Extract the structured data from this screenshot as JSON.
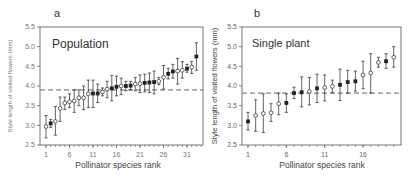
{
  "chart_data": [
    {
      "panel": "a",
      "type": "scatter",
      "title": "Population",
      "xlabel": "Pollinator species rank",
      "ylabel": "Style length of visited flowers (mm)",
      "xticks": [
        1,
        6,
        11,
        16,
        21,
        26,
        31
      ],
      "yticks": [
        2.5,
        3.0,
        3.5,
        4.0,
        4.5,
        5.0,
        5.5
      ],
      "ylim": [
        2.5,
        5.5
      ],
      "xlim": [
        0,
        34
      ],
      "reference_line": 3.9,
      "grid": false,
      "points": [
        {
          "x": 1,
          "y": 2.97,
          "lo": 2.68,
          "hi": 3.25,
          "filled": false
        },
        {
          "x": 2,
          "y": 3.05,
          "lo": 2.95,
          "hi": 3.15,
          "filled": true
        },
        {
          "x": 3,
          "y": 3.1,
          "lo": 2.75,
          "hi": 3.48,
          "filled": false
        },
        {
          "x": 4,
          "y": 3.43,
          "lo": 3.1,
          "hi": 3.72,
          "filled": false
        },
        {
          "x": 5,
          "y": 3.57,
          "lo": 3.4,
          "hi": 3.72,
          "filled": false
        },
        {
          "x": 6,
          "y": 3.6,
          "lo": 3.45,
          "hi": 3.8,
          "filled": false
        },
        {
          "x": 7,
          "y": 3.62,
          "lo": 3.33,
          "hi": 3.9,
          "filled": false
        },
        {
          "x": 8,
          "y": 3.7,
          "lo": 3.5,
          "hi": 3.9,
          "filled": false
        },
        {
          "x": 9,
          "y": 3.7,
          "lo": 3.4,
          "hi": 4.0,
          "filled": false
        },
        {
          "x": 10,
          "y": 3.8,
          "lo": 3.45,
          "hi": 4.15,
          "filled": false
        },
        {
          "x": 11,
          "y": 3.81,
          "lo": 3.45,
          "hi": 4.15,
          "filled": true
        },
        {
          "x": 12,
          "y": 3.81,
          "lo": 3.58,
          "hi": 4.05,
          "filled": true
        },
        {
          "x": 13,
          "y": 3.85,
          "lo": 3.75,
          "hi": 3.95,
          "filled": false
        },
        {
          "x": 14,
          "y": 3.92,
          "lo": 3.7,
          "hi": 4.12,
          "filled": false
        },
        {
          "x": 15,
          "y": 3.94,
          "lo": 3.62,
          "hi": 4.27,
          "filled": true
        },
        {
          "x": 16,
          "y": 3.98,
          "lo": 3.75,
          "hi": 4.25,
          "filled": true
        },
        {
          "x": 17,
          "y": 4.0,
          "lo": 3.78,
          "hi": 4.2,
          "filled": false
        },
        {
          "x": 18,
          "y": 4.0,
          "lo": 3.88,
          "hi": 4.12,
          "filled": true
        },
        {
          "x": 19,
          "y": 4.01,
          "lo": 3.9,
          "hi": 4.12,
          "filled": true
        },
        {
          "x": 20,
          "y": 4.05,
          "lo": 3.88,
          "hi": 4.22,
          "filled": false
        },
        {
          "x": 21,
          "y": 4.06,
          "lo": 3.83,
          "hi": 4.28,
          "filled": false
        },
        {
          "x": 22,
          "y": 4.08,
          "lo": 3.85,
          "hi": 4.3,
          "filled": true
        },
        {
          "x": 23,
          "y": 4.09,
          "lo": 3.83,
          "hi": 4.33,
          "filled": true
        },
        {
          "x": 24,
          "y": 4.1,
          "lo": 3.8,
          "hi": 4.38,
          "filled": true
        },
        {
          "x": 25,
          "y": 4.12,
          "lo": 4.03,
          "hi": 4.22,
          "filled": false
        },
        {
          "x": 26,
          "y": 4.22,
          "lo": 3.92,
          "hi": 4.52,
          "filled": false
        },
        {
          "x": 27,
          "y": 4.31,
          "lo": 4.18,
          "hi": 4.45,
          "filled": true
        },
        {
          "x": 28,
          "y": 4.37,
          "lo": 4.2,
          "hi": 4.55,
          "filled": true
        },
        {
          "x": 29,
          "y": 4.38,
          "lo": 4.05,
          "hi": 4.7,
          "filled": false
        },
        {
          "x": 30,
          "y": 4.4,
          "lo": 4.2,
          "hi": 4.62,
          "filled": false
        },
        {
          "x": 31,
          "y": 4.44,
          "lo": 4.35,
          "hi": 4.55,
          "filled": true
        },
        {
          "x": 32,
          "y": 4.48,
          "lo": 4.32,
          "hi": 4.62,
          "filled": false
        },
        {
          "x": 33,
          "y": 4.75,
          "lo": 4.4,
          "hi": 5.1,
          "filled": true
        }
      ]
    },
    {
      "panel": "b",
      "type": "scatter",
      "title": "Single plant",
      "xlabel": "Pollinator species rank",
      "ylabel": "Style length of visited flowers (mm)",
      "xticks": [
        1,
        6,
        11,
        16
      ],
      "yticks": [
        2.5,
        3.0,
        3.5,
        4.0,
        4.5,
        5.0,
        5.5
      ],
      "ylim": [
        2.5,
        5.5
      ],
      "xlim": [
        0,
        21
      ],
      "reference_line": 3.82,
      "grid": false,
      "points": [
        {
          "x": 1,
          "y": 3.1,
          "lo": 2.88,
          "hi": 3.33,
          "filled": true
        },
        {
          "x": 2,
          "y": 3.25,
          "lo": 2.85,
          "hi": 3.65,
          "filled": false
        },
        {
          "x": 3,
          "y": 3.3,
          "lo": 2.82,
          "hi": 3.8,
          "filled": false
        },
        {
          "x": 4,
          "y": 3.32,
          "lo": 3.1,
          "hi": 3.55,
          "filled": false
        },
        {
          "x": 5,
          "y": 3.55,
          "lo": 3.27,
          "hi": 3.82,
          "filled": false
        },
        {
          "x": 6,
          "y": 3.57,
          "lo": 3.33,
          "hi": 3.8,
          "filled": true
        },
        {
          "x": 7,
          "y": 3.82,
          "lo": 3.68,
          "hi": 3.97,
          "filled": true
        },
        {
          "x": 8,
          "y": 3.84,
          "lo": 3.47,
          "hi": 4.23,
          "filled": true
        },
        {
          "x": 9,
          "y": 3.86,
          "lo": 3.52,
          "hi": 4.22,
          "filled": false
        },
        {
          "x": 10,
          "y": 3.94,
          "lo": 3.58,
          "hi": 4.3,
          "filled": true
        },
        {
          "x": 11,
          "y": 3.96,
          "lo": 3.62,
          "hi": 4.28,
          "filled": false
        },
        {
          "x": 12,
          "y": 3.99,
          "lo": 3.83,
          "hi": 4.15,
          "filled": false
        },
        {
          "x": 13,
          "y": 4.03,
          "lo": 3.63,
          "hi": 4.43,
          "filled": true
        },
        {
          "x": 14,
          "y": 4.1,
          "lo": 3.82,
          "hi": 4.4,
          "filled": true
        },
        {
          "x": 15,
          "y": 4.12,
          "lo": 3.87,
          "hi": 4.38,
          "filled": true
        },
        {
          "x": 16,
          "y": 4.28,
          "lo": 3.93,
          "hi": 4.63,
          "filled": false
        },
        {
          "x": 17,
          "y": 4.33,
          "lo": 3.82,
          "hi": 4.82,
          "filled": false
        },
        {
          "x": 18,
          "y": 4.6,
          "lo": 4.48,
          "hi": 4.73,
          "filled": false
        },
        {
          "x": 19,
          "y": 4.63,
          "lo": 4.45,
          "hi": 4.82,
          "filled": true
        },
        {
          "x": 20,
          "y": 4.73,
          "lo": 4.48,
          "hi": 5.0,
          "filled": false
        }
      ]
    }
  ],
  "panels": {
    "a": {
      "label": "a",
      "title": "Population",
      "xlabel": "Pollinator species rank",
      "ylabel": "Style length of visited flowers (mm)"
    },
    "b": {
      "label": "b",
      "title": "Single plant",
      "xlabel": "Pollinator species rank",
      "ylabel": "Style length of visited flowers (mm)"
    }
  },
  "colors": {
    "axis": "#555555",
    "tick_label": "#666666",
    "marker": "#222222",
    "dashed_line": "#666666",
    "text": "#333333"
  }
}
